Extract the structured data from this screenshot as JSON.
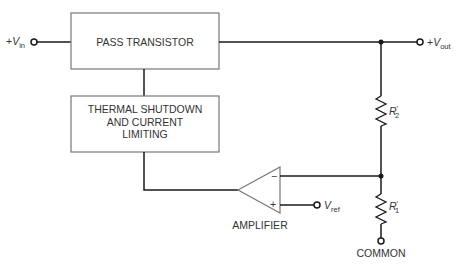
{
  "diagram": {
    "blocks": {
      "pass_transistor": "PASS TRANSISTOR",
      "thermal_line1": "THERMAL SHUTDOWN",
      "thermal_line2": "AND CURRENT",
      "thermal_line3": "LIMITING",
      "amplifier": "AMPLIFIER"
    },
    "terminals": {
      "vin_prefix": "+",
      "vin_main": "V",
      "vin_sub": "in",
      "vout_prefix": "+",
      "vout_main": "V",
      "vout_sub": "out",
      "vref_main": "V",
      "vref_sub": "ref",
      "common": "COMMON"
    },
    "components": {
      "r2_main": "R",
      "r2_prime": "′",
      "r2_sub": "2",
      "r1_main": "R",
      "r1_prime": "′",
      "r1_sub": "1"
    },
    "amp_pins": {
      "inverting": "−",
      "noninverting": "+"
    },
    "colors": {
      "line": "#1a1a1a",
      "box_stroke": "#777777",
      "text": "#333333"
    }
  }
}
